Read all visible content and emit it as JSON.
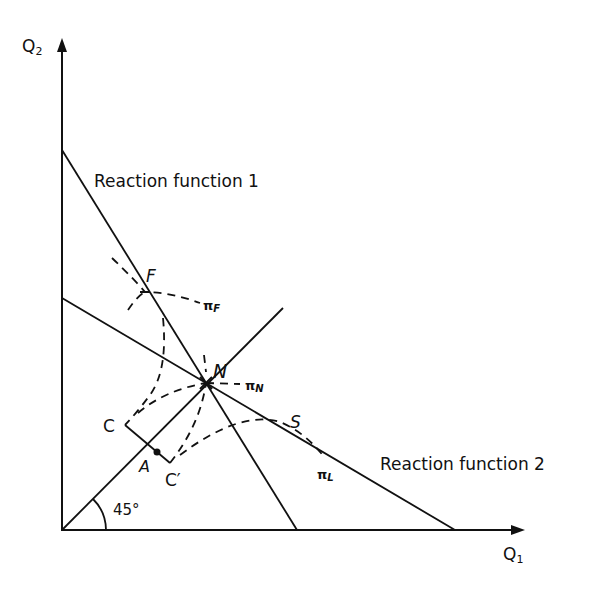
{
  "diagram": {
    "type": "economics-reaction-functions",
    "axes": {
      "x_label": "Q",
      "x_sub": "1",
      "y_label": "Q",
      "y_sub": "2"
    },
    "lines": {
      "rf1_label": "Reaction function 1",
      "rf2_label": "Reaction function 2",
      "angle_label": "45°"
    },
    "points": {
      "F": "F",
      "N": "N",
      "S": "S",
      "C": "C",
      "C_prime": "C′",
      "A": "A"
    },
    "isoprofit": {
      "pi_F": "π",
      "pi_F_sub": "F",
      "pi_N": "π",
      "pi_N_sub": "N",
      "pi_L": "π",
      "pi_L_sub": "L"
    },
    "colors": {
      "ink": "#111111",
      "background": "#ffffff"
    }
  }
}
